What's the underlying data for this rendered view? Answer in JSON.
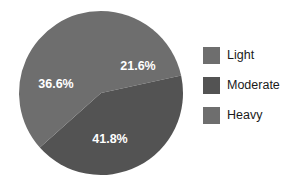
{
  "chart_data": {
    "type": "pie",
    "title": "",
    "categories": [
      "Light",
      "Moderate",
      "Heavy"
    ],
    "values": [
      21.6,
      41.8,
      36.6
    ],
    "data_labels": [
      "21.6%",
      "41.8%",
      "36.6%"
    ],
    "units": "percent",
    "start_angle_deg": 0,
    "direction": "clockwise",
    "legend_position": "right",
    "grid": false,
    "colors": [
      "#6e6e6e",
      "#535353",
      "#6e6e6e"
    ],
    "label_color": "#ffffff",
    "background": "#ffffff"
  },
  "legend": {
    "items": [
      {
        "label": "Light",
        "color": "#6e6e6e",
        "value": "21.6%"
      },
      {
        "label": "Moderate",
        "color": "#535353",
        "value": "41.8%"
      },
      {
        "label": "Heavy",
        "color": "#6e6e6e",
        "value": "36.6%"
      }
    ]
  },
  "pie": {
    "center_x": 101,
    "center_y": 93,
    "radius": 82,
    "slices": [
      {
        "name": "Light",
        "label": "21.6%",
        "label_x": 138,
        "label_y": 67
      },
      {
        "name": "Moderate",
        "label": "41.8%",
        "label_x": 110,
        "label_y": 140
      },
      {
        "name": "Heavy",
        "label": "36.6%",
        "label_x": 56,
        "label_y": 85
      }
    ]
  }
}
